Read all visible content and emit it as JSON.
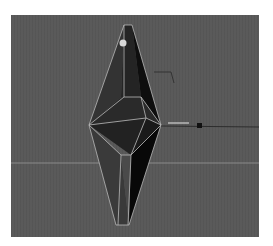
{
  "viewport": {
    "type": "3d-perspective",
    "background_color": "#5a5a5a",
    "grid_line_color": "#8a8a8a",
    "wire_color": "#b9b9b9",
    "object": {
      "name": "crystal-mesh",
      "shape": "elongated bipyramid",
      "dark_face_color": "#1c1c1c",
      "mid_face_color": "#2e2e2e",
      "light_face_color": "#4a4a4a"
    },
    "pivot_handle_color": "#d8d8d8",
    "manipulator_handle_color": "#111111"
  }
}
